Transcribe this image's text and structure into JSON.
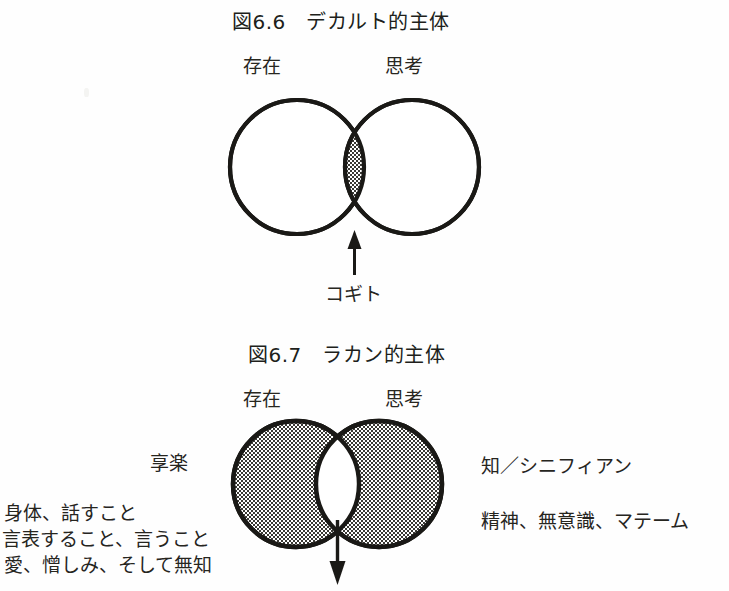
{
  "page": {
    "background_color": "#fefefe",
    "ink_color": "#26251f",
    "width": 729,
    "height": 591
  },
  "figure_1": {
    "title": "図6.6　デカルト的主体",
    "left_circle_label": "存在",
    "right_circle_label": "思考",
    "arrow_label": "コギト",
    "arrow_direction": "up",
    "shading": "intersection-only",
    "left_circle_fill": "white",
    "right_circle_fill": "white",
    "intersection_fill": "hatched"
  },
  "figure_2": {
    "title": "図6.7　ラカン的主体",
    "left_circle_label": "存在",
    "right_circle_label": "思考",
    "arrow_direction": "down",
    "shading": "circles-only",
    "left_circle_fill": "hatched",
    "right_circle_fill": "hatched",
    "intersection_fill": "white",
    "left_annotations": {
      "heading": "享楽",
      "lines": [
        "身体、話すこと",
        "言表すること、言うこと",
        "愛、憎しみ、そして無知"
      ]
    },
    "right_annotations": {
      "heading": "知／シニフィアン",
      "lines": [
        "精神、無意識、マテーム"
      ]
    }
  }
}
